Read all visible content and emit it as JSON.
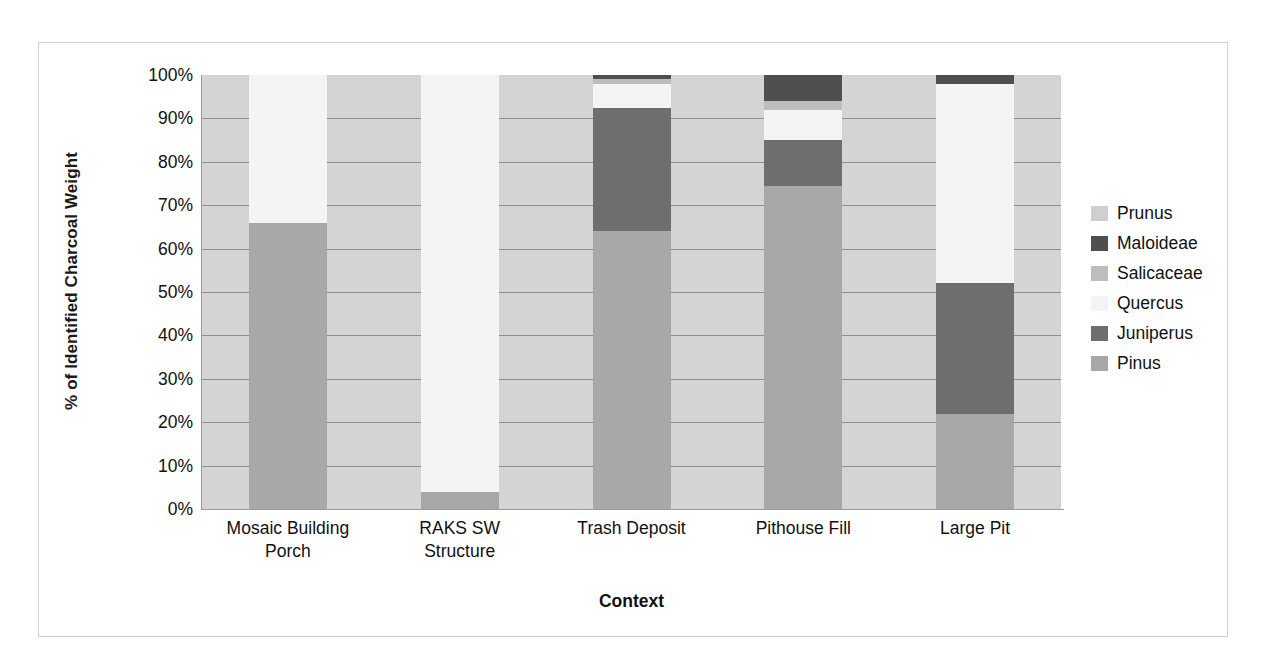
{
  "chart_data": {
    "type": "bar",
    "subtype": "stacked-100-percent",
    "title": "",
    "xlabel": "Context",
    "ylabel": "% of Identified Charcoal Weight",
    "ylim": [
      0,
      100
    ],
    "grid": true,
    "legend_position": "right",
    "categories": [
      "Mosaic Building Porch",
      "RAKS SW Structure",
      "Trash Deposit",
      "Pithouse Fill",
      "Large Pit"
    ],
    "category_lines": [
      [
        "Mosaic Building",
        "Porch"
      ],
      [
        "RAKS SW",
        "Structure"
      ],
      [
        "Trash Deposit"
      ],
      [
        "Pithouse Fill"
      ],
      [
        "Large Pit"
      ]
    ],
    "ytick_labels": [
      "100%",
      "90%",
      "80%",
      "70%",
      "60%",
      "50%",
      "40%",
      "30%",
      "20%",
      "10%",
      "0%"
    ],
    "ytick_values": [
      100,
      90,
      80,
      70,
      60,
      50,
      40,
      30,
      20,
      10,
      0
    ],
    "series": [
      {
        "name": "Pinus",
        "color": "#a8a8a8",
        "values": [
          66.0,
          4.0,
          64.0,
          74.5,
          22.0
        ]
      },
      {
        "name": "Juniperus",
        "color": "#6e6e6e",
        "values": [
          0.0,
          0.0,
          28.5,
          10.5,
          30.0
        ]
      },
      {
        "name": "Quercus",
        "color": "#f4f4f4",
        "values": [
          34.0,
          96.0,
          5.5,
          7.0,
          46.0
        ]
      },
      {
        "name": "Salicaceae",
        "color": "#bdbdbd",
        "values": [
          0.0,
          0.0,
          1.0,
          2.0,
          0.0
        ]
      },
      {
        "name": "Maloideae",
        "color": "#4f4f4f",
        "values": [
          0.0,
          0.0,
          1.0,
          6.0,
          2.0
        ]
      },
      {
        "name": "Prunus",
        "color": "#cfcfcf",
        "values": [
          0.0,
          0.0,
          0.0,
          0.0,
          0.0
        ]
      }
    ],
    "legend_entries": [
      {
        "label": "Prunus",
        "color": "#cfcfcf"
      },
      {
        "label": "Maloideae",
        "color": "#4f4f4f"
      },
      {
        "label": "Salicaceae",
        "color": "#bdbdbd"
      },
      {
        "label": "Quercus",
        "color": "#f4f4f4"
      },
      {
        "label": "Juniperus",
        "color": "#6e6e6e"
      },
      {
        "label": "Pinus",
        "color": "#a8a8a8"
      }
    ],
    "plot_background": "#d4d4d4",
    "gridline_color": "#8e8e8e",
    "frame_border_color": "#d2d2d2"
  }
}
